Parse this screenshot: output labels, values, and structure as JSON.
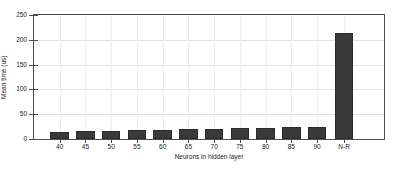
{
  "chart_data": {
    "type": "bar",
    "title": "",
    "xlabel": "Neurons in hidden layer",
    "ylabel": "Mean time (us)",
    "categories": [
      "40",
      "45",
      "50",
      "55",
      "60",
      "65",
      "70",
      "75",
      "80",
      "85",
      "90",
      "N-R"
    ],
    "values": [
      15,
      16,
      17,
      18,
      19,
      20,
      21,
      22,
      23,
      24,
      25,
      214
    ],
    "ylim": [
      0,
      250
    ],
    "yticks": [
      0,
      50,
      100,
      150,
      200,
      250
    ],
    "ytick_labels": [
      "0",
      "50",
      "100",
      "150",
      "200",
      "250"
    ],
    "grid": true,
    "legend": null,
    "bar_color": "#3a3a3a",
    "background_color": "#ffffff",
    "axis_color": "#4d4d4d",
    "grid_color": "#e2e2e2"
  }
}
